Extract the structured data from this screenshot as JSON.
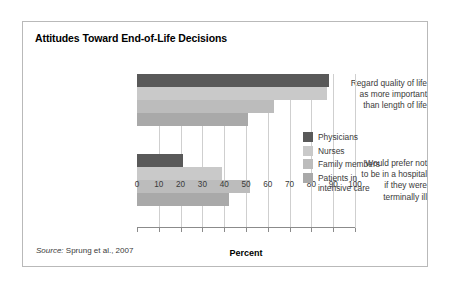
{
  "figure": {
    "title": "Attitudes Toward End-of-Life Decisions",
    "source_prefix": "Source:",
    "source_text": " Sprung et al., 2007"
  },
  "legend": {
    "position": "inside-right",
    "items": [
      {
        "label": "Physicians",
        "color": "#595959"
      },
      {
        "label": "Nurses",
        "color": "#c9c9c9"
      },
      {
        "label": "Family members",
        "color": "#bcbcbc"
      },
      {
        "label": "Patients in\nintensive care",
        "color": "#a9a9a9"
      }
    ]
  },
  "chart_data": {
    "type": "bar",
    "orientation": "horizontal",
    "title": "Attitudes Toward End-of-Life Decisions",
    "xlabel": "Percent",
    "ylabel": "",
    "xlim": [
      0,
      100
    ],
    "xticks": [
      0,
      10,
      20,
      30,
      40,
      50,
      60,
      70,
      80,
      90,
      100
    ],
    "xtick_labels": [
      "0",
      "10",
      "20",
      "30",
      "40",
      "50",
      "60",
      "70",
      "80",
      "90",
      "100"
    ],
    "grid": true,
    "grid_axis": "x",
    "categories": [
      "Regard quality of life\nas more important\nthan length of life",
      "Would prefer not\nto be in a hospital\nif they were\nterminally ill"
    ],
    "series": [
      {
        "name": "Physicians",
        "color": "#595959",
        "values": [
          88,
          21
        ]
      },
      {
        "name": "Nurses",
        "color": "#c9c9c9",
        "values": [
          87,
          39
        ]
      },
      {
        "name": "Family members",
        "color": "#bcbcbc",
        "values": [
          63,
          52
        ]
      },
      {
        "name": "Patients in intensive care",
        "color": "#a9a9a9",
        "values": [
          51,
          42
        ]
      }
    ],
    "units": "percent",
    "source": "Sprung et al., 2007"
  }
}
